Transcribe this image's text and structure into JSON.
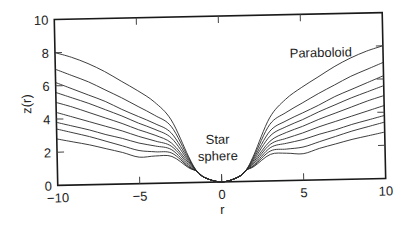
{
  "chart_data": {
    "type": "line",
    "title": "",
    "xlabel": "r",
    "ylabel": "z(r)",
    "xlim": [
      -10,
      10
    ],
    "ylim": [
      0,
      10
    ],
    "grid": false,
    "legend": null,
    "x_ticks": [
      -10,
      -5,
      0,
      5,
      10
    ],
    "x_tick_labels": [
      "−10",
      "−5",
      "0",
      "5",
      "10"
    ],
    "y_ticks": [
      0,
      2,
      4,
      6,
      8,
      10
    ],
    "y_tick_labels": [
      "0",
      "2",
      "4",
      "6",
      "8",
      "10"
    ],
    "annotations": [
      {
        "text": "Paraboloid",
        "x": 6.2,
        "y": 7.4
      },
      {
        "text": "Star",
        "x": -0.2,
        "y": 2.3
      },
      {
        "text": "sphere",
        "x": -0.2,
        "y": 1.3
      }
    ],
    "symmetric_about_r0": true,
    "sphere_radius": 2,
    "r_samples": [
      0,
      1,
      1.5,
      2,
      3,
      4,
      5,
      6,
      7,
      8,
      9,
      10
    ],
    "series": [
      {
        "name": "curve-1",
        "values": [
          0,
          0.27,
          0.68,
          1.6,
          3.8,
          4.9,
          5.6,
          6.2,
          6.8,
          7.3,
          7.7,
          8.0
        ]
      },
      {
        "name": "curve-2",
        "values": [
          0,
          0.27,
          0.68,
          1.5,
          3.4,
          4.1,
          4.65,
          5.2,
          5.7,
          6.2,
          6.6,
          7.0
        ]
      },
      {
        "name": "curve-3",
        "values": [
          0,
          0.27,
          0.68,
          1.4,
          3.0,
          3.6,
          4.05,
          4.5,
          5.0,
          5.4,
          5.8,
          6.2
        ]
      },
      {
        "name": "curve-4",
        "values": [
          0,
          0.27,
          0.68,
          1.3,
          2.7,
          3.25,
          3.65,
          4.1,
          4.5,
          4.9,
          5.25,
          5.6
        ]
      },
      {
        "name": "curve-5",
        "values": [
          0,
          0.27,
          0.68,
          1.2,
          2.4,
          2.9,
          3.25,
          3.65,
          4.0,
          4.35,
          4.7,
          5.0
        ]
      },
      {
        "name": "curve-6",
        "values": [
          0,
          0.27,
          0.68,
          1.1,
          2.2,
          2.55,
          2.85,
          3.2,
          3.5,
          3.8,
          4.1,
          4.4
        ]
      },
      {
        "name": "curve-7",
        "values": [
          0,
          0.27,
          0.68,
          1.0,
          2.0,
          2.25,
          2.45,
          2.75,
          3.0,
          3.3,
          3.55,
          3.8
        ]
      },
      {
        "name": "curve-8",
        "values": [
          0,
          0.27,
          0.68,
          0.95,
          1.8,
          1.9,
          2.0,
          2.3,
          2.6,
          2.9,
          3.15,
          3.4
        ]
      },
      {
        "name": "curve-9",
        "values": [
          0,
          0.27,
          0.68,
          0.9,
          1.6,
          1.65,
          1.6,
          1.9,
          2.15,
          2.4,
          2.6,
          2.8
        ]
      }
    ]
  }
}
